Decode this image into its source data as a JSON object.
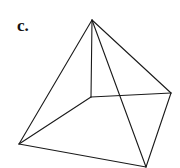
{
  "figure": {
    "label": "c.",
    "stroke_color": "#1a1a1a",
    "vertices": {
      "apex": {
        "x": 92,
        "y": 20
      },
      "left": {
        "x": 19,
        "y": 144
      },
      "back": {
        "x": 91,
        "y": 97
      },
      "right": {
        "x": 171,
        "y": 93
      },
      "front": {
        "x": 146,
        "y": 167
      }
    },
    "edges": [
      [
        "apex",
        "left"
      ],
      [
        "apex",
        "back"
      ],
      [
        "apex",
        "front"
      ],
      [
        "apex",
        "right"
      ],
      [
        "left",
        "back"
      ],
      [
        "back",
        "right"
      ],
      [
        "right",
        "front"
      ],
      [
        "front",
        "left"
      ]
    ]
  }
}
